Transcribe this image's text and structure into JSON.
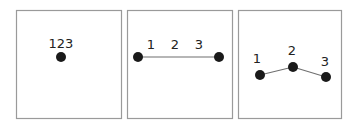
{
  "panels": [
    {
      "name": "collapsed",
      "frame": {
        "x": 16,
        "y": 10,
        "w": 105,
        "h": 108
      },
      "labels": [
        {
          "text": "123",
          "x": 61,
          "y": 48
        }
      ],
      "points": [
        {
          "x": 61,
          "y": 57
        }
      ],
      "edges": []
    },
    {
      "name": "linear",
      "frame": {
        "x": 127,
        "y": 10,
        "w": 105,
        "h": 108
      },
      "labels": [
        {
          "text": "1",
          "x": 151,
          "y": 49
        },
        {
          "text": "2",
          "x": 175,
          "y": 49
        },
        {
          "text": "3",
          "x": 199,
          "y": 49
        }
      ],
      "points": [
        {
          "x": 138,
          "y": 57
        },
        {
          "x": 219,
          "y": 57
        }
      ],
      "edges": [
        {
          "x1": 138,
          "y1": 57,
          "x2": 219,
          "y2": 57
        }
      ]
    },
    {
      "name": "bent",
      "frame": {
        "x": 238,
        "y": 10,
        "w": 103,
        "h": 108
      },
      "labels": [
        {
          "text": "1",
          "x": 257,
          "y": 63
        },
        {
          "text": "2",
          "x": 292,
          "y": 55
        },
        {
          "text": "3",
          "x": 325,
          "y": 66
        }
      ],
      "points": [
        {
          "x": 260,
          "y": 75
        },
        {
          "x": 293,
          "y": 67
        },
        {
          "x": 326,
          "y": 77
        }
      ],
      "edges": [
        {
          "x1": 260,
          "y1": 75,
          "x2": 293,
          "y2": 67
        },
        {
          "x1": 293,
          "y1": 67,
          "x2": 326,
          "y2": 77
        }
      ]
    }
  ],
  "colors": {
    "frame": "#9a9a9a",
    "point": "#1a1a1a",
    "edge": "#6f6f6f",
    "text": "#222222"
  },
  "point_radius": 5
}
